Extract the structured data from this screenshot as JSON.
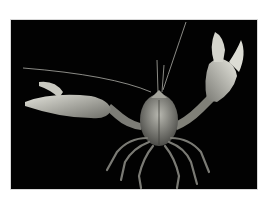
{
  "image": {
    "subject": "crayfish",
    "description": "Crayfish with raised claws photographed against a black background",
    "colors": {
      "background": "#020202",
      "border": "#ffffff",
      "subject_light": "#d8d8d0",
      "subject_mid": "#8a8a84",
      "subject_dark": "#4a4a46"
    }
  }
}
